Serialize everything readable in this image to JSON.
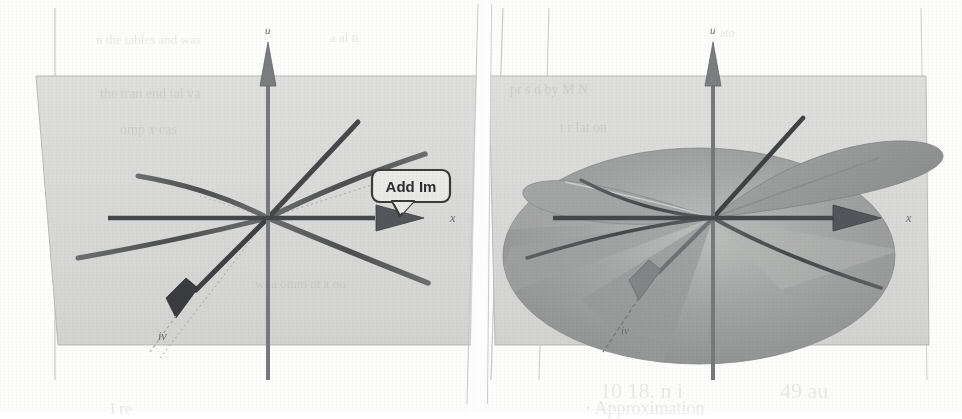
{
  "figure": {
    "kind": "scanned-textbook-figure",
    "background_color": "#fdfdfc",
    "panel_plane_color": "#d9dad8",
    "surface_color": "#9a9c9b",
    "surface_highlight_color": "#c6c7c5",
    "curve_color": "#555758",
    "axis_color": "#4a4c4e",
    "dotted_guide_color": "#9ea0a2",
    "divider_note": "narrow white vertical gap separates the two panels"
  },
  "callout": {
    "label": "Add Im",
    "shape": "rounded-rectangle-with-pointer-tail",
    "border_color": "#3a3a3a",
    "fill_color": "#e9eae8",
    "text_color": "#2e2e2e"
  },
  "left_panel": {
    "name": "real-plane-with-branch-curves",
    "axes": [
      {
        "id": "u",
        "label": "u",
        "orientation": "vertical",
        "arrow": "up"
      },
      {
        "id": "x",
        "label": "x",
        "orientation": "horizontal",
        "arrow": "right"
      },
      {
        "id": "iv",
        "label": "iv",
        "orientation": "diagonal",
        "arrow": "down-left"
      }
    ],
    "origin": {
      "x": 268,
      "y": 218
    },
    "curves": [
      {
        "id": "upper-left-branch",
        "style": "solid"
      },
      {
        "id": "upper-right-branch",
        "style": "solid"
      },
      {
        "id": "lower-left-branch",
        "style": "solid"
      },
      {
        "id": "lower-right-branch",
        "style": "solid"
      },
      {
        "id": "rising-ray",
        "style": "solid-thick"
      }
    ],
    "guides": [
      {
        "id": "dotted-diagonal-upper",
        "style": "dotted"
      },
      {
        "id": "dotted-diagonal-lower",
        "style": "dotted"
      }
    ]
  },
  "right_panel": {
    "name": "riemann-surface-added",
    "axes": [
      {
        "id": "u",
        "label": "u",
        "orientation": "vertical",
        "arrow": "up"
      },
      {
        "id": "x",
        "label": "x",
        "orientation": "horizontal",
        "arrow": "right"
      },
      {
        "id": "iv",
        "label": "iv",
        "orientation": "diagonal",
        "arrow": "down-left"
      }
    ],
    "origin": {
      "x": 232,
      "y": 218
    },
    "surfaces": [
      {
        "id": "upper-lobe",
        "shape": "elongated-blade",
        "shade": "mid-gray"
      },
      {
        "id": "lower-sheet",
        "shape": "large-ellipse",
        "shade": "dark-gray"
      }
    ],
    "fold_lines": [
      {
        "id": "fold-upper-left"
      },
      {
        "id": "fold-left"
      },
      {
        "id": "fold-lower-left"
      },
      {
        "id": "fold-lower-right"
      },
      {
        "id": "fold-right"
      }
    ]
  },
  "ghost_text": [
    {
      "id": "ghost-1",
      "text": "n the tables and was",
      "x": 96,
      "y": 32,
      "size": 13
    },
    {
      "id": "ghost-2",
      "text": "a  al  ti",
      "x": 330,
      "y": 30,
      "size": 13
    },
    {
      "id": "ghost-3",
      "text": "ato",
      "x": 720,
      "y": 26,
      "size": 12
    },
    {
      "id": "ghost-4",
      "text": "the tran  end  tal va",
      "x": 100,
      "y": 86,
      "size": 14
    },
    {
      "id": "ghost-5",
      "text": "pr  s  d  by  M  N",
      "x": 510,
      "y": 82,
      "size": 14
    },
    {
      "id": "ghost-6",
      "text": "omp  x  cas",
      "x": 120,
      "y": 122,
      "size": 14
    },
    {
      "id": "ghost-7",
      "text": "t  r  lat on",
      "x": 560,
      "y": 120,
      "size": 14
    },
    {
      "id": "ghost-8",
      "text": "wi  a  omm  nt a  ou",
      "x": 255,
      "y": 276,
      "size": 13
    },
    {
      "id": "ghost-9",
      "text": "10 18.  n   i",
      "x": 600,
      "y": 378,
      "size": 22
    },
    {
      "id": "ghost-10",
      "text": "49 au",
      "x": 780,
      "y": 378,
      "size": 22
    },
    {
      "id": "ghost-11",
      "text": "·  Approximation",
      "x": 585,
      "y": 398,
      "size": 18
    },
    {
      "id": "ghost-12",
      "text": "I  re",
      "x": 110,
      "y": 400,
      "size": 16
    }
  ]
}
